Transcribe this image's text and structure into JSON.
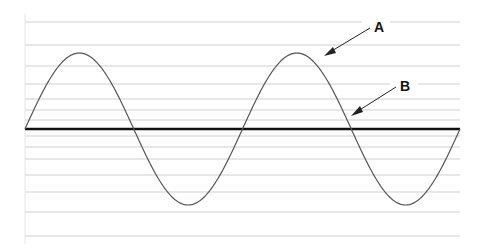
{
  "diagram": {
    "type": "waveform",
    "labels": {
      "a": "A",
      "b": "B"
    },
    "colors": {
      "background": "#ffffff",
      "gridline": "#cfcfcf",
      "curve": "#555555",
      "baseline": "#111111",
      "arrow": "#222222"
    },
    "gridlines_y": [
      22,
      45,
      66,
      84,
      99,
      110,
      120,
      136,
      147,
      159,
      175,
      192,
      212,
      236
    ],
    "plot": {
      "x_start": 25,
      "x_end": 460,
      "baseline_y": 129,
      "amplitude": 76,
      "cycles": 2
    }
  }
}
